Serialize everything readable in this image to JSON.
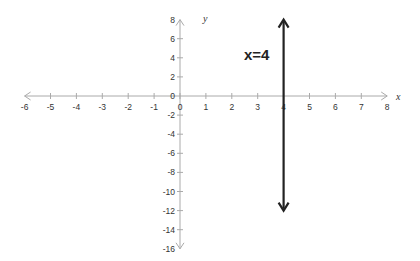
{
  "chart_data": {
    "type": "line",
    "title": "",
    "xlabel": "x",
    "ylabel": "y",
    "xlim": [
      -6,
      8
    ],
    "ylim": [
      -16,
      8
    ],
    "x_ticks": [
      -6,
      -5,
      -4,
      -3,
      -2,
      -1,
      0,
      1,
      2,
      3,
      4,
      5,
      6,
      7,
      8
    ],
    "y_ticks": [
      8,
      6,
      4,
      2,
      0,
      -2,
      -4,
      -6,
      -8,
      -10,
      -12,
      -14,
      -16
    ],
    "grid": false,
    "series": [
      {
        "name": "x=4",
        "type": "vertical-line",
        "x": [
          4,
          4
        ],
        "y": [
          8,
          -12
        ],
        "arrows": "both",
        "color": "#222222"
      }
    ],
    "annotations": [
      {
        "text": "x=4",
        "x": 3,
        "y": 5
      }
    ],
    "axis_color": "#aaaaaa"
  },
  "labels": {
    "x_axis_name": "x",
    "y_axis_name": "y",
    "line_label": "x=4",
    "x_tick_labels": [
      "-6",
      "-5",
      "-4",
      "-3",
      "-2",
      "-1",
      "0",
      "1",
      "2",
      "3",
      "4",
      "5",
      "6",
      "7",
      "8"
    ],
    "y_tick_labels": [
      "8",
      "6",
      "4",
      "2",
      "0",
      "-2",
      "-4",
      "-6",
      "-8",
      "-10",
      "-12",
      "-14",
      "-16"
    ]
  }
}
